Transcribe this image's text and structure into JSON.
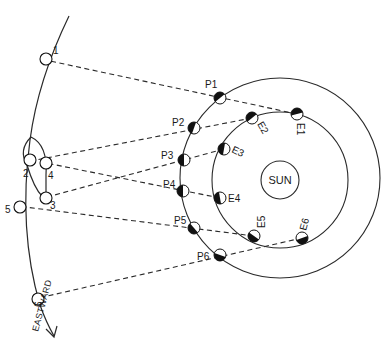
{
  "diagram": {
    "colors": {
      "line": "#2a2a2a",
      "background": "#ffffff",
      "fill_dark": "#111111"
    },
    "sun": {
      "label": "SUN",
      "cx": 280,
      "cy": 180,
      "r": 19
    },
    "earth_orbit": {
      "cx": 280,
      "cy": 180,
      "r": 68
    },
    "mars_orbit": {
      "cx": 280,
      "cy": 178,
      "r": 100
    },
    "earth_positions": [
      {
        "label": "E1",
        "x": 297,
        "y": 114
      },
      {
        "label": "E2",
        "x": 252,
        "y": 118
      },
      {
        "label": "E3",
        "x": 224,
        "y": 149
      },
      {
        "label": "E4",
        "x": 220,
        "y": 198
      },
      {
        "label": "E5",
        "x": 254,
        "y": 236
      },
      {
        "label": "E6",
        "x": 302,
        "y": 238
      }
    ],
    "mars_positions": [
      {
        "label": "P1",
        "x": 220,
        "y": 98
      },
      {
        "label": "P2",
        "x": 194,
        "y": 128
      },
      {
        "label": "P3",
        "x": 184,
        "y": 160
      },
      {
        "label": "P4",
        "x": 183,
        "y": 191
      },
      {
        "label": "P5",
        "x": 194,
        "y": 228
      },
      {
        "label": "P6",
        "x": 220,
        "y": 255
      }
    ],
    "sky_positions": [
      {
        "label": "1",
        "x": 46,
        "y": 59
      },
      {
        "label": "2",
        "x": 30,
        "y": 160
      },
      {
        "label": "3",
        "x": 46,
        "y": 198
      },
      {
        "label": "4",
        "x": 46,
        "y": 163
      },
      {
        "label": "5",
        "x": 20,
        "y": 207
      },
      {
        "label": "6",
        "x": 38,
        "y": 299
      }
    ],
    "direction_label": "EASTWARD"
  }
}
